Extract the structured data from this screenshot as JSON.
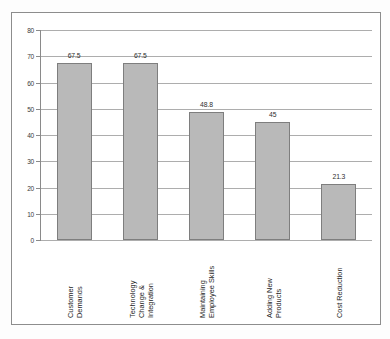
{
  "chart_data": {
    "type": "bar",
    "title": "",
    "subtitle": "",
    "xlabel": "",
    "ylabel": "",
    "categories": [
      "Customer Demands",
      "Technology Change & Integration",
      "Maintaining Employee Skills",
      "Adding New Products",
      "Cost Reduction"
    ],
    "category_lines": [
      [
        "Customer",
        "Demands"
      ],
      [
        "Technology",
        "Change &",
        "Integration"
      ],
      [
        "Maintaining",
        "Employee Skills"
      ],
      [
        "Adding New",
        "Products"
      ],
      [
        "Cost Reduction"
      ]
    ],
    "values": [
      67.5,
      67.5,
      48.8,
      45,
      21.3
    ],
    "value_labels": [
      "67.5",
      "67.5",
      "48.8",
      "45",
      "21.3"
    ],
    "ylim": [
      0,
      80
    ],
    "y_ticks": [
      0,
      10,
      20,
      30,
      40,
      50,
      60,
      70,
      80
    ],
    "y_tick_labels": [
      "0",
      "10",
      "20",
      "30",
      "40",
      "50",
      "60",
      "70",
      "80"
    ],
    "grid": true,
    "legend": "none",
    "colors": {
      "bar_fill": "#b9b9b9",
      "bar_border": "#7e7e7e",
      "gridline": "#adadad",
      "axis": "#8a8a8a",
      "frame": "#8d8d8d",
      "background": "#ffffff",
      "text": "#262626"
    }
  }
}
